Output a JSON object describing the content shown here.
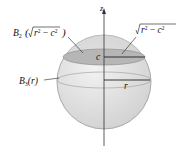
{
  "figure": {
    "axis_label": "z",
    "cap_ball_label": {
      "base": "B",
      "sub": "2",
      "arg_prefix": "(",
      "arg_var": "r",
      "arg_exp": "2",
      "arg_minus": " − ",
      "arg_c": "c",
      "arg_c_exp": "2",
      "arg_suffix": ")"
    },
    "cap_radius_label": {
      "var": "r",
      "exp": "2",
      "minus": " − ",
      "c": "c",
      "c_exp": "2"
    },
    "ball_label": {
      "base": "B",
      "sub": "3",
      "arg": "(r)"
    },
    "height_label": "c",
    "radius_label": "r",
    "colors": {
      "sphere_fill": "#e4e4e4",
      "sphere_stroke": "#9a9a9a",
      "cap_fill": "#b9b9b9",
      "axis": "#333333",
      "line": "#222222"
    }
  }
}
